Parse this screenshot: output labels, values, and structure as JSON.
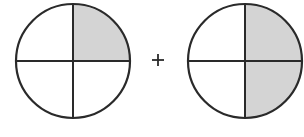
{
  "figure": {
    "left_circle": {
      "parts": 4,
      "shaded": [
        "top-right"
      ],
      "fraction": "1/4"
    },
    "operator": "+",
    "right_circle": {
      "parts": 4,
      "shaded": [
        "top-right",
        "bottom-right"
      ],
      "fraction": "2/4"
    },
    "colors": {
      "stroke": "#2a2a2a",
      "shade": "#d4d4d4",
      "background": "#ffffff"
    }
  }
}
